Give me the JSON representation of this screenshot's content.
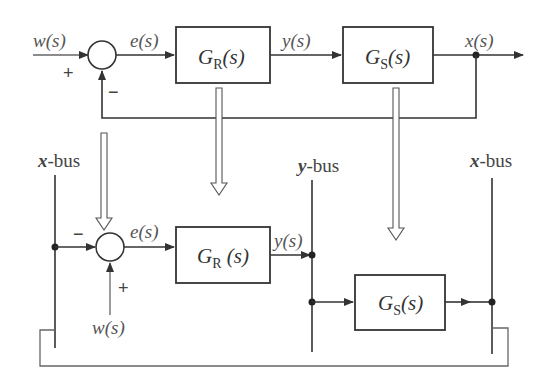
{
  "diagram": {
    "top_loop": {
      "input_label": "w(s)",
      "plus_sign": "+",
      "minus_sign": "−",
      "error_label": "e(s)",
      "controller": {
        "name": "G",
        "subscript": "R",
        "arg": "(s)"
      },
      "control_label": "y(s)",
      "plant": {
        "name": "G",
        "subscript": "S",
        "arg": "(s)"
      },
      "output_label": "x(s)"
    },
    "bus_structure": {
      "left_bus": {
        "var": "x",
        "suffix": "-bus"
      },
      "middle_bus": {
        "var": "y",
        "suffix": "-bus"
      },
      "right_bus": {
        "var": "x",
        "suffix": "-bus"
      },
      "minus_sign": "−",
      "plus_sign": "+",
      "error_label": "e(s)",
      "input_label": "w(s)",
      "controller": {
        "name": "G",
        "subscript": "R",
        "arg": " (s)"
      },
      "control_label": "y(s)",
      "plant": {
        "name": "G",
        "subscript": "S",
        "arg": "(s)"
      }
    }
  }
}
